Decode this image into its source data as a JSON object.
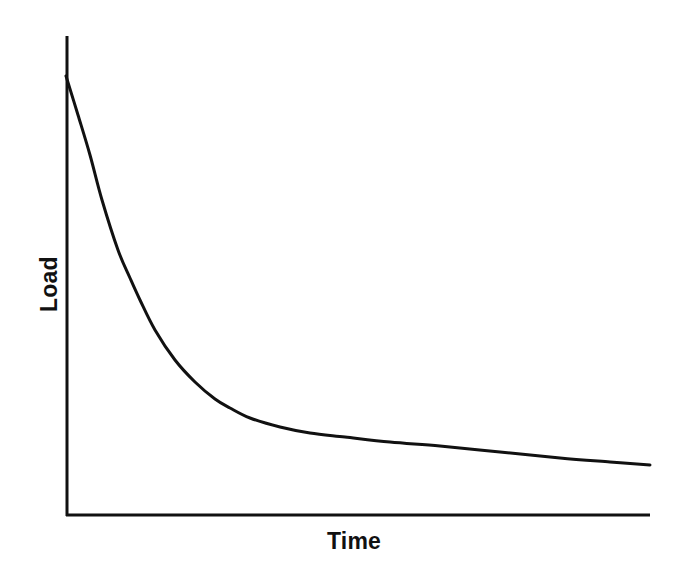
{
  "figure": {
    "background_color": "#ffffff",
    "ink_color": "#111111",
    "width": 675,
    "height": 568
  },
  "labels": {
    "y_axis_title": "Load",
    "x_axis_title": "Time"
  },
  "chart_data": {
    "type": "line",
    "title": "",
    "subtitle": "",
    "xlabel": "Time",
    "ylabel": "Load",
    "xlim": [
      0,
      100
    ],
    "ylim": [
      0,
      100
    ],
    "grid": false,
    "legend": null,
    "legend_position": "none",
    "axis_ticks": {
      "x": [],
      "y": []
    },
    "axis_tick_labels": {
      "x": [],
      "y": []
    },
    "axes_style": {
      "spines": [
        "left",
        "bottom"
      ],
      "arrowheads": false,
      "line_width_px": 3,
      "origin_px": [
        66,
        516
      ],
      "y_axis_top_px": 36,
      "x_axis_right_px": 650
    },
    "annotations": [],
    "series": [
      {
        "name": "Load decay",
        "color": "#111111",
        "line_width_px": 3,
        "description": "Monotonically decreasing exponential-like decay curve; steep initial drop from the y-axis then a long flattening tail approaching an asymptote above the x-axis.",
        "x": [
          0,
          2,
          4,
          6,
          8,
          10,
          12,
          14,
          16,
          18,
          20,
          24,
          28,
          32,
          36,
          40,
          48,
          56,
          64,
          72,
          80,
          88,
          96,
          100
        ],
        "y": [
          92,
          84,
          76,
          69,
          62,
          56,
          50,
          44,
          39,
          35,
          31,
          26,
          23,
          21,
          19.5,
          18.5,
          17,
          16,
          15,
          14.2,
          13.5,
          12.8,
          12.1,
          11.8
        ],
        "points_px": [
          [
            66,
            76
          ],
          [
            78,
            115
          ],
          [
            90,
            155
          ],
          [
            102,
            200
          ],
          [
            118,
            250
          ],
          [
            130,
            278
          ],
          [
            140,
            300
          ],
          [
            155,
            330
          ],
          [
            175,
            360
          ],
          [
            195,
            382
          ],
          [
            215,
            399
          ],
          [
            230,
            408
          ],
          [
            250,
            418
          ],
          [
            280,
            427
          ],
          [
            310,
            433
          ],
          [
            345,
            437
          ],
          [
            390,
            442
          ],
          [
            440,
            446
          ],
          [
            500,
            452
          ],
          [
            560,
            458
          ],
          [
            610,
            462
          ],
          [
            650,
            465
          ]
        ]
      }
    ]
  }
}
